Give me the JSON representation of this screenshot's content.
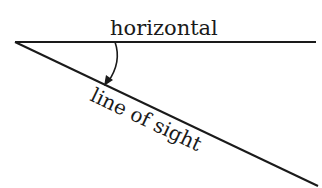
{
  "diagram": {
    "labels": {
      "horizontal": "horizontal",
      "line_of_sight": "line of sight"
    },
    "colors": {
      "stroke": "#1a1a1a",
      "background": "#ffffff"
    }
  }
}
